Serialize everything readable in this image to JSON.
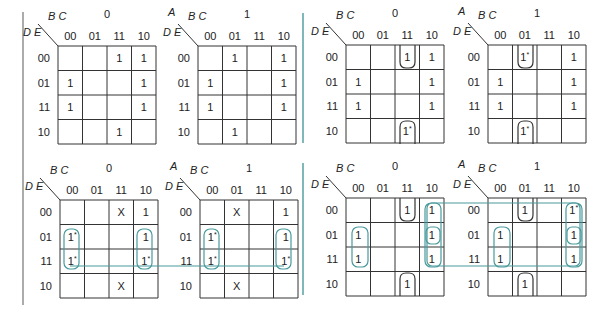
{
  "figure": {
    "colors": {
      "grid": "#333333",
      "teal": "#4a9a9c",
      "divider_gray": "#888888",
      "text": "#222222"
    },
    "labels": {
      "row_var": "D E",
      "col_var": "B C",
      "outer_var": "A",
      "col_codes": [
        "00",
        "01",
        "11",
        "10"
      ],
      "row_codes": [
        "00",
        "01",
        "11",
        "10"
      ]
    },
    "panels": [
      {
        "name": "top-left",
        "maps": [
          {
            "a_value": "0",
            "x": 58,
            "y": 46,
            "cells": [
              [
                "",
                "",
                "1",
                "1"
              ],
              [
                "1",
                "",
                "",
                "1"
              ],
              [
                "1",
                "",
                "",
                "1"
              ],
              [
                "",
                "",
                "1",
                ""
              ]
            ]
          },
          {
            "a_value": "1",
            "x": 198,
            "y": 46,
            "cells": [
              [
                "",
                "1",
                "",
                "1"
              ],
              [
                "1",
                "",
                "",
                "1"
              ],
              [
                "1",
                "",
                "",
                "1"
              ],
              [
                "",
                "1",
                "",
                ""
              ]
            ]
          }
        ]
      },
      {
        "name": "top-right",
        "maps": [
          {
            "a_value": "0",
            "x": 346,
            "y": 45,
            "cells": [
              [
                "",
                "",
                "1",
                "1"
              ],
              [
                "1",
                "",
                "",
                "1"
              ],
              [
                "1",
                "",
                "",
                "1"
              ],
              [
                "",
                "",
                "1*",
                ""
              ]
            ]
          },
          {
            "a_value": "1",
            "x": 488,
            "y": 45,
            "cells": [
              [
                "",
                "1*",
                "",
                "1"
              ],
              [
                "1",
                "",
                "",
                "1"
              ],
              [
                "1",
                "",
                "",
                "1"
              ],
              [
                "",
                "1*",
                "",
                ""
              ]
            ]
          }
        ]
      },
      {
        "name": "bottom-left",
        "maps": [
          {
            "a_value": "0",
            "x": 60,
            "y": 200,
            "cells": [
              [
                "",
                "",
                "X",
                "1"
              ],
              [
                "1*",
                "",
                "",
                "1"
              ],
              [
                "1*",
                "",
                "",
                "1*"
              ],
              [
                "",
                "",
                "X",
                ""
              ]
            ]
          },
          {
            "a_value": "1",
            "x": 200,
            "y": 200,
            "cells": [
              [
                "",
                "X",
                "",
                "1"
              ],
              [
                "1*",
                "",
                "",
                "1"
              ],
              [
                "1*",
                "",
                "",
                "1*"
              ],
              [
                "",
                "X",
                "",
                ""
              ]
            ]
          }
        ]
      },
      {
        "name": "bottom-right",
        "maps": [
          {
            "a_value": "0",
            "x": 346,
            "y": 198,
            "cells": [
              [
                "",
                "",
                "1",
                "1"
              ],
              [
                "1",
                "",
                "",
                "1"
              ],
              [
                "1",
                "",
                "",
                "1"
              ],
              [
                "",
                "",
                "1",
                ""
              ]
            ]
          },
          {
            "a_value": "1",
            "x": 488,
            "y": 198,
            "cells": [
              [
                "",
                "1",
                "",
                "1*"
              ],
              [
                "1",
                "",
                "",
                "1"
              ],
              [
                "1",
                "",
                "",
                "1"
              ],
              [
                "",
                "1",
                "",
                ""
              ]
            ]
          }
        ]
      }
    ],
    "cell_size": 24.5,
    "dividers": [
      {
        "name": "left-gray-divider",
        "x": 23,
        "y1": 12,
        "y2": 305,
        "color": "#888888"
      },
      {
        "name": "top-teal-divider",
        "x": 303,
        "y1": 13,
        "y2": 143,
        "color": "#4a9a9c"
      },
      {
        "name": "bottom-teal-divider",
        "x": 303,
        "y1": 163,
        "y2": 295,
        "color": "#4a9a9c"
      }
    ]
  }
}
